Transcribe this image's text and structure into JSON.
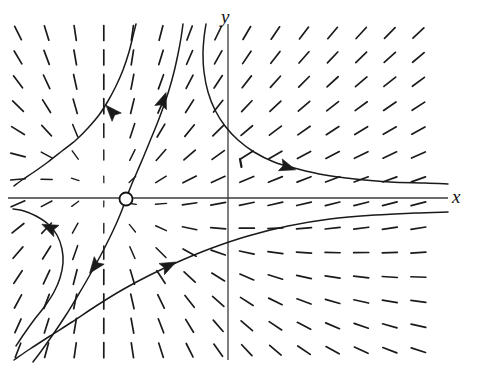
{
  "figure": {
    "kind": "direction-field-phase-portrait",
    "width": 479,
    "height": 380,
    "background_color": "#ffffff",
    "stroke_color": "#1a1a1a"
  },
  "axes": {
    "x_label": "x",
    "y_label": "y",
    "x_axis_pixel_y": 198,
    "y_axis_pixel_x": 228,
    "x_axis_from": [
      8,
      198
    ],
    "x_axis_to": [
      448,
      198
    ],
    "y_axis_from": [
      228,
      24
    ],
    "y_axis_to": [
      228,
      360
    ],
    "axis_color": "#3a3a3a",
    "axis_width": 1.6
  },
  "chart_data": {
    "type": "scatter",
    "title": "",
    "xlabel": "x",
    "ylabel": "y",
    "grid": false,
    "legend": null,
    "field": {
      "marker": "line-segment",
      "origin_px": [
        228,
        198
      ],
      "x_start_px": 18,
      "x_step_px": 28.6,
      "x_count": 15,
      "y_start_px": 33,
      "y_step_px": 24.4,
      "y_count": 14,
      "segment_half_length_px": 7.5,
      "slope_model": "dy/dx = (y - y0*k) / (x - x0) style saddle about equilibrium",
      "equilibrium_px": [
        126,
        199
      ]
    },
    "equilibrium_point": {
      "label": "saddle point",
      "marker": "open-circle",
      "center_px": [
        126,
        199
      ],
      "radius_px": 6.5,
      "fill": "#ffffff",
      "stroke": "#111111"
    },
    "trajectories": [
      {
        "name": "upper-left-branch",
        "points_px": [
          [
            14,
            186
          ],
          [
            22,
            180
          ],
          [
            34,
            172
          ],
          [
            48,
            162
          ],
          [
            62,
            151
          ],
          [
            76,
            140
          ],
          [
            88,
            128
          ],
          [
            99,
            115
          ],
          [
            108,
            101
          ],
          [
            116,
            86
          ],
          [
            123,
            70
          ],
          [
            129,
            52
          ],
          [
            133,
            36
          ],
          [
            136,
            24
          ]
        ],
        "arrows": [
          {
            "at_px": [
              112,
              112
            ],
            "angle_deg": 228
          }
        ]
      },
      {
        "name": "unstable-separatrix-upper",
        "points_px": [
          [
            126,
            199
          ],
          [
            131,
            186
          ],
          [
            137,
            172
          ],
          [
            143,
            158
          ],
          [
            150,
            141
          ],
          [
            157,
            124
          ],
          [
            163,
            108
          ],
          [
            169,
            90
          ],
          [
            174,
            72
          ],
          [
            178,
            54
          ],
          [
            181,
            38
          ],
          [
            183,
            24
          ]
        ],
        "arrows": [
          {
            "at_px": [
              163,
              101
            ],
            "angle_deg": 290
          }
        ]
      },
      {
        "name": "upper-right-branch",
        "points_px": [
          [
            206,
            24
          ],
          [
            204,
            38
          ],
          [
            203,
            54
          ],
          [
            204,
            72
          ],
          [
            208,
            92
          ],
          [
            215,
            110
          ],
          [
            225,
            126
          ],
          [
            238,
            140
          ],
          [
            254,
            152
          ],
          [
            274,
            162
          ],
          [
            298,
            169
          ],
          [
            325,
            175
          ],
          [
            355,
            179
          ],
          [
            390,
            182
          ],
          [
            425,
            183
          ],
          [
            448,
            184
          ]
        ],
        "arrows": [
          {
            "at_px": [
              287,
              167
            ],
            "angle_deg": 18
          }
        ]
      },
      {
        "name": "stable-separatrix-lower",
        "points_px": [
          [
            126,
            199
          ],
          [
            122,
            210
          ],
          [
            117,
            222
          ],
          [
            111,
            235
          ],
          [
            104,
            249
          ],
          [
            96,
            264
          ],
          [
            87,
            280
          ],
          [
            77,
            297
          ],
          [
            66,
            315
          ],
          [
            54,
            333
          ],
          [
            42,
            350
          ],
          [
            33,
            362
          ]
        ],
        "arrows": [
          {
            "at_px": [
              95,
              266
            ],
            "angle_deg": 127
          }
        ]
      },
      {
        "name": "lower-left-hook",
        "points_px": [
          [
            13,
            209
          ],
          [
            24,
            211
          ],
          [
            36,
            216
          ],
          [
            48,
            224
          ],
          [
            57,
            235
          ],
          [
            62,
            249
          ],
          [
            63,
            263
          ],
          [
            60,
            278
          ],
          [
            54,
            292
          ],
          [
            45,
            306
          ],
          [
            34,
            320
          ],
          [
            24,
            334
          ],
          [
            16,
            346
          ]
        ],
        "arrows": [
          {
            "at_px": [
              50,
              228
            ],
            "angle_deg": 205
          }
        ]
      },
      {
        "name": "lower-right-branch",
        "points_px": [
          [
            14,
            360
          ],
          [
            30,
            349
          ],
          [
            50,
            336
          ],
          [
            72,
            322
          ],
          [
            96,
            306
          ],
          [
            122,
            290
          ],
          [
            150,
            275
          ],
          [
            180,
            261
          ],
          [
            212,
            248
          ],
          [
            248,
            236
          ],
          [
            288,
            226
          ],
          [
            330,
            219
          ],
          [
            375,
            215
          ],
          [
            415,
            213
          ],
          [
            448,
            212
          ]
        ],
        "arrows": [
          {
            "at_px": [
              168,
              266
            ],
            "angle_deg": 334
          }
        ]
      }
    ],
    "tick_marks": [
      {
        "name": "stray-tick",
        "at_px": [
          240,
          163
        ]
      }
    ]
  }
}
